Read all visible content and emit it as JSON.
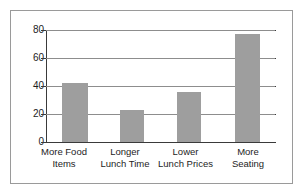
{
  "chart_data": {
    "type": "bar",
    "title": "",
    "subtitle": "",
    "xlabel": "",
    "ylabel": "",
    "categories": [
      "More Food Items",
      "Longer Lunch Time",
      "Lower Lunch Prices",
      "More Seating"
    ],
    "category_lines": [
      [
        "More Food",
        "Items"
      ],
      [
        "Longer",
        "Lunch Time"
      ],
      [
        "Lower",
        "Lunch Prices"
      ],
      [
        "More",
        "Seating"
      ]
    ],
    "values": [
      42,
      23,
      36,
      77
    ],
    "ylim": [
      0,
      80
    ],
    "yticks": [
      0,
      20,
      40,
      60,
      80
    ],
    "ytick_labels": [
      "0",
      "20",
      "40",
      "60",
      "80"
    ],
    "grid": true,
    "grid_axis": "y",
    "legend": false,
    "legend_position": "none",
    "bar_color": "#9e9e9e",
    "grid_color": "#8d8d8d",
    "axis_color": "#3a3a3a",
    "frame_color": "#9a9a9a",
    "background_color": "#ffffff",
    "text_color": "#1d1d1d"
  }
}
